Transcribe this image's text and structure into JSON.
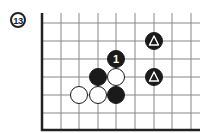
{
  "diagram": {
    "number": "13",
    "board": {
      "columns_x": [
        42,
        61,
        79,
        98,
        116,
        135,
        154,
        172,
        191
      ],
      "rows_y": [
        23,
        41,
        59,
        77,
        95,
        113,
        130
      ],
      "top_y": 13,
      "right_x": 200,
      "left_edge_thick": true,
      "bottom_edge_thick": true,
      "line_color": "#888888",
      "edge_color": "#222222"
    },
    "stones": [
      {
        "color": "black",
        "x": 116,
        "y": 59,
        "mark": "1"
      },
      {
        "color": "black",
        "x": 98,
        "y": 77,
        "mark": ""
      },
      {
        "color": "white",
        "x": 116,
        "y": 77,
        "mark": ""
      },
      {
        "color": "white",
        "x": 79,
        "y": 95,
        "mark": ""
      },
      {
        "color": "white",
        "x": 98,
        "y": 95,
        "mark": ""
      },
      {
        "color": "black",
        "x": 116,
        "y": 95,
        "mark": ""
      },
      {
        "color": "black",
        "x": 154,
        "y": 41,
        "mark": "triangle"
      },
      {
        "color": "black",
        "x": 154,
        "y": 77,
        "mark": "triangle"
      }
    ],
    "stone_radius": 8.5
  }
}
